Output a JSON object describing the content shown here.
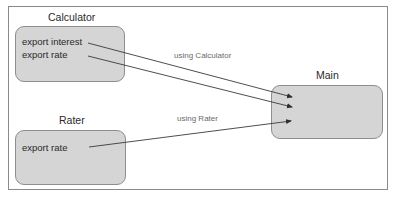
{
  "diagram": {
    "modules": [
      {
        "id": "calculator",
        "title": "Calculator",
        "exports": [
          "export interest",
          "export rate"
        ]
      },
      {
        "id": "rater",
        "title": "Rater",
        "exports": [
          "export rate"
        ]
      },
      {
        "id": "main",
        "title": "Main",
        "exports": []
      }
    ],
    "edges": [
      {
        "from": "calculator.export interest",
        "to": "main",
        "label": "using Calculator"
      },
      {
        "from": "calculator.export rate",
        "to": "main",
        "label": ""
      },
      {
        "from": "rater.export rate",
        "to": "main",
        "label": "using Rater"
      }
    ],
    "edge_labels": {
      "calculator": "using Calculator",
      "rater": "using Rater"
    }
  },
  "colors": {
    "box_fill": "#d5d5d5",
    "box_border": "#8e8e8e",
    "frame_border": "#8a8a8a",
    "edge": "#3a3a3a",
    "label_text": "#6a6a6a"
  }
}
